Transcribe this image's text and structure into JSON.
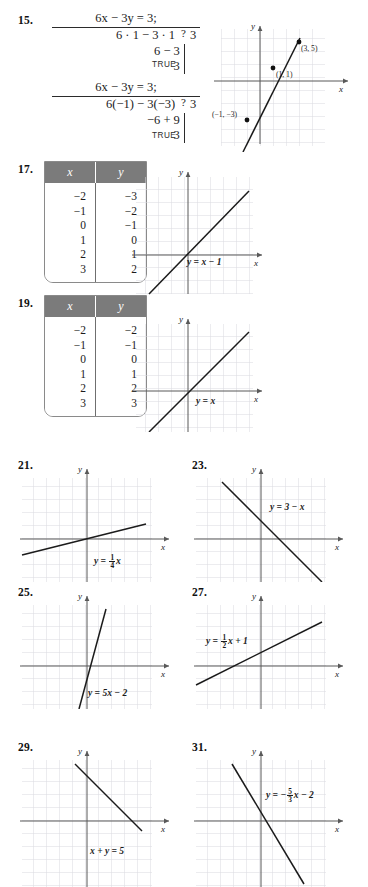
{
  "page": {
    "grid_color": "#d9d9e0",
    "axis_color": "#595959",
    "line_color": "#1b1b1b",
    "table_header_bg": "#7b7b7b",
    "axis_label_x": "x",
    "axis_label_y": "y"
  },
  "problems": [
    {
      "number": "15.",
      "checks": [
        {
          "equation": "6x − 3y = 3;",
          "rows": [
            {
              "lhs": "6 · 1 − 3 · 1",
              "op": "?",
              "rhs": "3"
            },
            {
              "lhs": "6 − 3",
              "op": "",
              "rhs": ""
            },
            {
              "lhs": "3",
              "op": "",
              "rhs": ""
            }
          ],
          "verdict": "TRUE"
        },
        {
          "equation": "6x − 3y = 3;",
          "rows": [
            {
              "lhs": "6(−1) − 3(−3)",
              "op": "?",
              "rhs": "3"
            },
            {
              "lhs": "−6 + 9",
              "op": "",
              "rhs": ""
            },
            {
              "lhs": "3",
              "op": "",
              "rhs": ""
            }
          ],
          "verdict": "TRUE"
        }
      ],
      "graph": {
        "points": [
          {
            "label": "(3, 5)",
            "x": 3,
            "y": 5
          },
          {
            "label": "(1, 1)",
            "x": 1,
            "y": 1
          },
          {
            "label": "(−1, −3)",
            "x": -1,
            "y": -3
          }
        ],
        "line": {
          "slope": 2,
          "intercept": -1
        }
      }
    },
    {
      "number": "17.",
      "table": {
        "headers": [
          "x",
          "y"
        ],
        "rows": [
          [
            "−2",
            "−3"
          ],
          [
            "−1",
            "−2"
          ],
          [
            "0",
            "−1"
          ],
          [
            "1",
            "0"
          ],
          [
            "2",
            "1"
          ],
          [
            "3",
            "2"
          ]
        ]
      },
      "graph": {
        "equation_label": "y = x − 1",
        "line": {
          "slope": 1,
          "intercept": -1
        }
      }
    },
    {
      "number": "19.",
      "table": {
        "headers": [
          "x",
          "y"
        ],
        "rows": [
          [
            "−2",
            "−2"
          ],
          [
            "−1",
            "−1"
          ],
          [
            "0",
            "0"
          ],
          [
            "1",
            "1"
          ],
          [
            "2",
            "2"
          ],
          [
            "3",
            "3"
          ]
        ]
      },
      "graph": {
        "equation_label": "y = x",
        "line": {
          "slope": 1,
          "intercept": 0
        }
      }
    },
    {
      "number": "21.",
      "graph": {
        "equation_parts": {
          "lead": "y = ",
          "num": "1",
          "den": "4",
          "tail": "x"
        },
        "line": {
          "slope": 0.25,
          "intercept": 0
        }
      }
    },
    {
      "number": "23.",
      "graph": {
        "equation_label": "y = 3 − x",
        "line": {
          "slope": -1,
          "intercept": 3
        }
      }
    },
    {
      "number": "25.",
      "graph": {
        "equation_label": "y = 5x − 2",
        "line": {
          "slope": 5,
          "intercept": -2
        }
      }
    },
    {
      "number": "27.",
      "graph": {
        "equation_parts": {
          "lead": "y = ",
          "num": "1",
          "den": "2",
          "tail": "x + 1"
        },
        "line": {
          "slope": 0.5,
          "intercept": 1
        }
      }
    },
    {
      "number": "29.",
      "graph": {
        "equation_label": "x + y = 5",
        "line": {
          "slope": -1,
          "intercept": 5
        }
      }
    },
    {
      "number": "31.",
      "graph": {
        "equation_parts": {
          "lead": "y = −",
          "num": "5",
          "den": "3",
          "tail": "x − 2"
        },
        "line": {
          "slope": -1.6667,
          "intercept": -2
        }
      }
    }
  ]
}
